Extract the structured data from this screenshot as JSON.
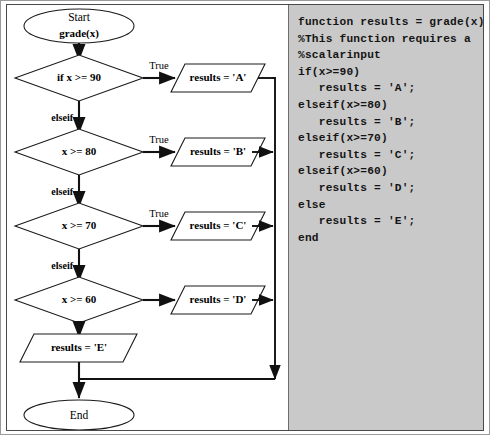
{
  "figure": {
    "left_panel_kind": "flowchart",
    "right_panel_kind": "source-code"
  },
  "flowchart": {
    "start": {
      "line1": "Start",
      "line2": "grade(x)"
    },
    "end": {
      "label": "End"
    },
    "decisions": [
      {
        "id": "d90",
        "text": "if  x >= 90",
        "branch_label": "",
        "true_label": "True",
        "output": "results = 'A'"
      },
      {
        "id": "d80",
        "text": "x >= 80",
        "branch_label": "elseif",
        "true_label": "True",
        "output": "results = 'B'"
      },
      {
        "id": "d70",
        "text": "x >= 70",
        "branch_label": "elseif",
        "true_label": "True",
        "output": "results = 'C'"
      },
      {
        "id": "d60",
        "text": "x >= 60",
        "branch_label": "elseif",
        "true_label": "",
        "output": "results = 'D'"
      }
    ],
    "else_branch": {
      "branch_label": "else",
      "output": "results = 'E'"
    },
    "colors": {
      "shape_stroke": "#1a1a1a",
      "shape_fill": "#ffffff",
      "line": "#111111"
    }
  },
  "code": {
    "language": "MATLAB",
    "background": "#c9c9c9",
    "text": "function results = grade(x)\n%This function requires a\n%scalarinput\nif(x>=90)\n   results = 'A';\nelseif(x>=80)\n   results = 'B';\nelseif(x>=70)\n   results = 'C';\nelseif(x>=60)\n   results = 'D';\nelse\n   results = 'E';\nend",
    "lines": [
      "function results = grade(x)",
      "%This function requires a",
      "%scalarinput",
      "if(x>=90)",
      "   results = 'A';",
      "elseif(x>=80)",
      "   results = 'B';",
      "elseif(x>=70)",
      "   results = 'C';",
      "elseif(x>=60)",
      "   results = 'D';",
      "else",
      "   results = 'E';",
      "end"
    ]
  }
}
